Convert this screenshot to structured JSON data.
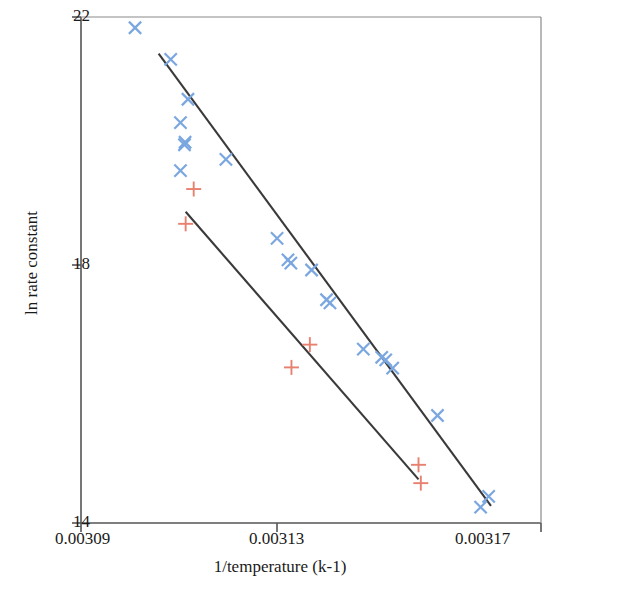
{
  "chart_data": {
    "type": "scatter",
    "title": "",
    "xlabel": "1/temperature (k-1)",
    "ylabel": "ln rate constant",
    "xlim": [
      0.00309,
      0.00317
    ],
    "ylim": [
      14,
      22
    ],
    "xticks": [
      "0.00309",
      "0.00313",
      "0.00317"
    ],
    "xtick_values": [
      0.00309,
      0.00313,
      0.00317
    ],
    "yticks": [
      "22",
      "18",
      "14"
    ],
    "ytick_values": [
      22,
      18,
      14
    ],
    "grid": false,
    "legend": null,
    "colors": {
      "series_1_marker": "#7ba7e0",
      "series_2_marker": "#e8806f",
      "trendline": "#3a3a3a",
      "axis": "#555555",
      "text": "#1a1a1a",
      "background": "#ffffff"
    },
    "series": [
      {
        "name": "series-1",
        "marker": "x",
        "color": "#7ba7e0",
        "points": [
          {
            "x": 0.0030994,
            "y": 21.83
          },
          {
            "x": 0.0031056,
            "y": 21.33
          },
          {
            "x": 0.0031086,
            "y": 20.7
          },
          {
            "x": 0.0031073,
            "y": 20.33
          },
          {
            "x": 0.0031081,
            "y": 20.02
          },
          {
            "x": 0.003108,
            "y": 19.98
          },
          {
            "x": 0.0031073,
            "y": 19.57
          },
          {
            "x": 0.0031152,
            "y": 19.75
          },
          {
            "x": 0.0031241,
            "y": 18.5
          },
          {
            "x": 0.003126,
            "y": 18.16
          },
          {
            "x": 0.0031265,
            "y": 18.11
          },
          {
            "x": 0.0031301,
            "y": 18.0
          },
          {
            "x": 0.0031327,
            "y": 17.53
          },
          {
            "x": 0.0031333,
            "y": 17.48
          },
          {
            "x": 0.0031391,
            "y": 16.75
          },
          {
            "x": 0.0031423,
            "y": 16.62
          },
          {
            "x": 0.003143,
            "y": 16.58
          },
          {
            "x": 0.0031442,
            "y": 16.45
          },
          {
            "x": 0.003152,
            "y": 15.7
          },
          {
            "x": 0.0031609,
            "y": 14.42
          },
          {
            "x": 0.0031595,
            "y": 14.25
          }
        ]
      },
      {
        "name": "series-2",
        "marker": "plus",
        "color": "#e8806f",
        "points": [
          {
            "x": 0.0031096,
            "y": 19.28
          },
          {
            "x": 0.0031082,
            "y": 18.73
          },
          {
            "x": 0.0031298,
            "y": 16.82
          },
          {
            "x": 0.0031266,
            "y": 16.46
          },
          {
            "x": 0.0031487,
            "y": 14.92
          },
          {
            "x": 0.0031491,
            "y": 14.63
          }
        ]
      }
    ],
    "trendlines": [
      {
        "name": "trendline-series-1",
        "x1": 0.0031035,
        "y1": 21.42,
        "x2": 0.0031613,
        "y2": 14.27
      },
      {
        "name": "trendline-series-2",
        "x1": 0.0031082,
        "y1": 18.92,
        "x2": 0.0031487,
        "y2": 14.69
      }
    ]
  },
  "axis": {
    "y_title": "ln rate constant",
    "x_title": "1/temperature (k-1)",
    "y_tick_top": "22",
    "y_tick_mid": "18",
    "y_tick_bottom": "14",
    "x_tick_left": "0.00309",
    "x_tick_mid": "0.00313",
    "x_tick_right": "0.00317"
  }
}
